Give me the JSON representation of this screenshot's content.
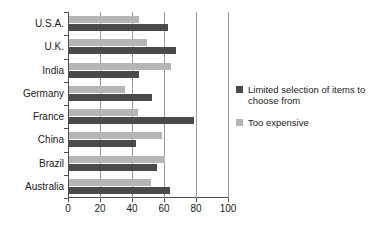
{
  "chart_data": {
    "type": "bar",
    "orientation": "horizontal",
    "title": "",
    "subtitle": "",
    "xlabel": "",
    "ylabel": "",
    "xlim": [
      0,
      100
    ],
    "xticks": [
      0,
      20,
      40,
      60,
      80,
      100
    ],
    "xtick_labels": [
      "0",
      "20",
      "40",
      "60",
      "80",
      "100"
    ],
    "grid": true,
    "grid_axis": "x",
    "legend_position": "right",
    "categories": [
      "U.S.A.",
      "U.K.",
      "India",
      "Germany",
      "France",
      "China",
      "Brazil",
      "Australia"
    ],
    "series": [
      {
        "name": "Limited selection of items to choose from",
        "color": "#4a4a4a",
        "values": [
          62,
          67,
          44,
          52,
          78,
          42,
          55,
          63
        ]
      },
      {
        "name": "Too expensive",
        "color": "#b5b5b5",
        "values": [
          44,
          49,
          64,
          35,
          43,
          58,
          60,
          51
        ]
      }
    ]
  },
  "legend": {
    "items": [
      {
        "label": "Limited selection of items to choose from",
        "color": "#4a4a4a",
        "swatch": "legend-swatch-dark"
      },
      {
        "label": "Too expensive",
        "color": "#b5b5b5",
        "swatch": "legend-swatch-light"
      }
    ]
  },
  "axis": {
    "x_tick_labels": [
      "0",
      "20",
      "40",
      "60",
      "80",
      "100"
    ]
  },
  "categories": [
    "U.S.A.",
    "U.K.",
    "India",
    "Germany",
    "France",
    "China",
    "Brazil",
    "Australia"
  ]
}
